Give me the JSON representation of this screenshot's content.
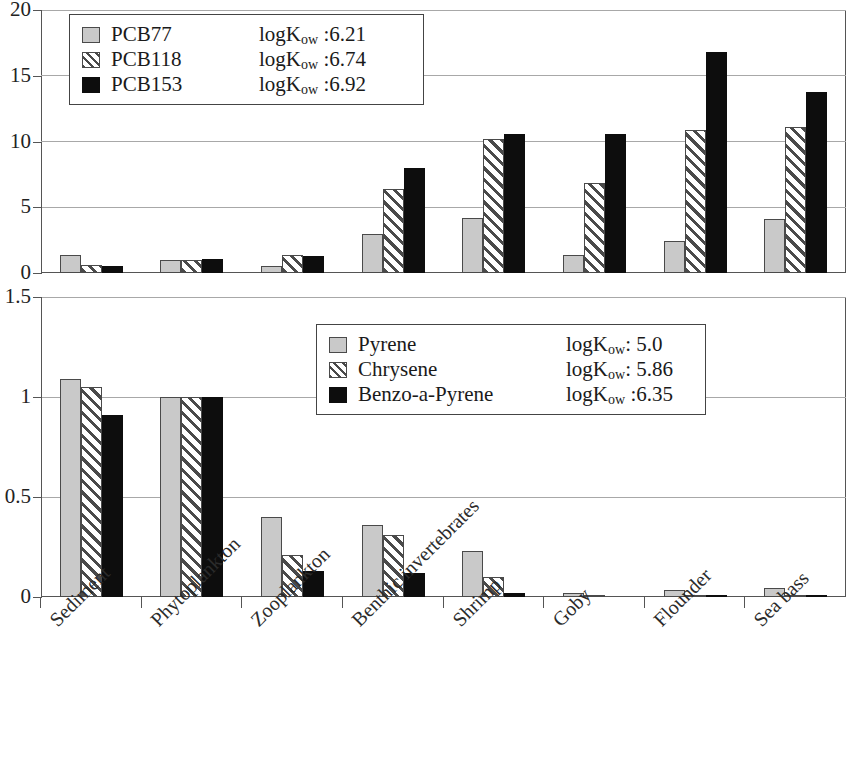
{
  "chart_data": [
    {
      "type": "bar",
      "panel": "top",
      "title": "",
      "xlabel": "",
      "ylabel": "",
      "ylim": [
        0,
        20
      ],
      "yticks": [
        0,
        5,
        10,
        15,
        20
      ],
      "ytick_labels": [
        "0",
        "5",
        "10",
        "15",
        "20"
      ],
      "grid": true,
      "legend_position": "top-left",
      "categories": [
        "Sediment",
        "Phytoplankton",
        "Zooplankton",
        "Benthic invertebrates",
        "Shrimp",
        "Goby",
        "Flounder",
        "Sea bass"
      ],
      "series": [
        {
          "name": "PCB77",
          "logKow": "6.21",
          "pattern": "solid-gray",
          "values": [
            1.4,
            1.0,
            0.5,
            3.0,
            4.2,
            1.35,
            2.4,
            4.1
          ]
        },
        {
          "name": "PCB118",
          "logKow": "6.74",
          "pattern": "hatched",
          "values": [
            0.6,
            1.0,
            1.4,
            6.4,
            10.2,
            6.85,
            10.9,
            11.1
          ]
        },
        {
          "name": "PCB153",
          "logKow": "6.92",
          "pattern": "solid-black",
          "values": [
            0.55,
            1.05,
            1.3,
            8.0,
            10.6,
            10.55,
            16.8,
            13.8
          ]
        }
      ]
    },
    {
      "type": "bar",
      "panel": "bottom",
      "title": "",
      "xlabel": "",
      "ylabel": "",
      "ylim": [
        0,
        1.5
      ],
      "yticks": [
        0,
        0.5,
        1,
        1.5
      ],
      "ytick_labels": [
        "0",
        "0.5",
        "1",
        "1.5"
      ],
      "grid": true,
      "legend_position": "top-right",
      "categories": [
        "Sediment",
        "Phytoplankton",
        "Zooplankton",
        "Benthic invertebrates",
        "Shrimp",
        "Goby",
        "Flounder",
        "Sea bass"
      ],
      "series": [
        {
          "name": "Pyrene",
          "logKow": "5.0",
          "pattern": "solid-gray",
          "values": [
            1.09,
            1.0,
            0.4,
            0.36,
            0.23,
            0.02,
            0.035,
            0.045
          ]
        },
        {
          "name": "Chrysene",
          "logKow": "5.86",
          "pattern": "hatched",
          "values": [
            1.05,
            1.0,
            0.21,
            0.31,
            0.1,
            0.012,
            0.012,
            0.012
          ]
        },
        {
          "name": "Benzo-a-Pyrene",
          "logKow": "6.35",
          "pattern": "solid-black",
          "values": [
            0.91,
            1.0,
            0.13,
            0.12,
            0.02,
            0.004,
            0.006,
            0.006
          ]
        }
      ]
    }
  ],
  "top_legend": {
    "rows": [
      {
        "name": "PCB77",
        "kow_prefix": "logK",
        "kow_sub": "ow",
        "kow_value": " :6.21"
      },
      {
        "name": "PCB118",
        "kow_prefix": "logK",
        "kow_sub": "ow",
        "kow_value": " :6.74"
      },
      {
        "name": "PCB153",
        "kow_prefix": "logK",
        "kow_sub": "ow",
        "kow_value": " :6.92"
      }
    ]
  },
  "bottom_legend": {
    "rows": [
      {
        "name": "Pyrene",
        "kow_prefix": "logK",
        "kow_sub": "ow",
        "kow_value": ": 5.0"
      },
      {
        "name": "Chrysene",
        "kow_prefix": "logK",
        "kow_sub": "ow",
        "kow_value": ": 5.86"
      },
      {
        "name": "Benzo-a-Pyrene",
        "kow_prefix": "logK",
        "kow_sub": "ow",
        "kow_value": " :6.35"
      }
    ]
  },
  "axes": {
    "top_ytick_labels": [
      "20",
      "15",
      "10",
      "5",
      "0"
    ],
    "bottom_ytick_labels": [
      "1.5",
      "1",
      "0.5",
      "0"
    ],
    "category_labels": [
      "Sediment",
      "Phytoplankton",
      "Zooplankton",
      "Benthic invertebrates",
      "Shrimp",
      "Goby",
      "Flounder",
      "Sea bass"
    ]
  },
  "colors": {
    "series_gray": "#c9c9c9",
    "series_black": "#0d0d0d",
    "grid": "#a8a8a8",
    "axis": "#555555",
    "text": "#1a1a1a"
  }
}
